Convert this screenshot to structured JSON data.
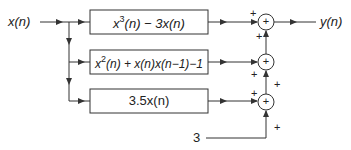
{
  "diagram": {
    "type": "block-diagram",
    "input_label": "x(n)",
    "output_label": "y(n)",
    "constant_input": "3",
    "blocks": [
      {
        "id": "top",
        "expr_parts": [
          "x",
          "3",
          "(n) − 3x(n)"
        ],
        "text": "x^3(n) − 3x(n)"
      },
      {
        "id": "middle",
        "expr_parts": [
          "x",
          "2",
          "(n) + x(n)x(n−1)−1"
        ],
        "text": "x^2(n) + x(n)x(n−1)−1"
      },
      {
        "id": "bottom",
        "text": "3.5x(n)"
      }
    ],
    "summers": [
      {
        "id": "sum1",
        "symbol": "+",
        "input_signs": [
          "+",
          "+"
        ]
      },
      {
        "id": "sum2",
        "symbol": "+",
        "input_signs": [
          "+",
          "+"
        ]
      },
      {
        "id": "sum3",
        "symbol": "+",
        "input_signs": [
          "+",
          "+"
        ]
      }
    ],
    "colors": {
      "line": "#333333",
      "background": "#ffffff"
    }
  }
}
